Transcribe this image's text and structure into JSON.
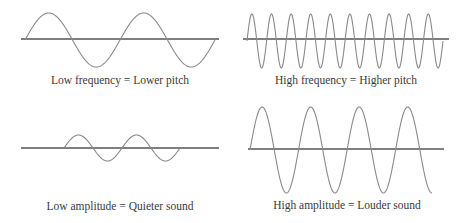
{
  "colors": {
    "wave": "#8a8a8a",
    "axis": "#555555",
    "text": "#3a3a3a",
    "background": "#ffffff"
  },
  "panels": [
    {
      "id": "low-frequency",
      "caption": "Low frequency = Lower pitch",
      "axis": {
        "y": 39,
        "x1": 21,
        "x2": 219
      },
      "wave": {
        "x_start": 25,
        "x_end": 215,
        "cycles": 2,
        "amplitude": 27,
        "baseline": 40
      }
    },
    {
      "id": "high-frequency",
      "caption": "High frequency = Higher pitch",
      "axis": {
        "y": 39,
        "x1": 243,
        "x2": 449
      },
      "wave": {
        "x_start": 247,
        "x_end": 443,
        "cycles": 10,
        "amplitude": 27,
        "baseline": 41
      }
    },
    {
      "id": "low-amplitude",
      "caption": "Low amplitude = Quieter sound",
      "axis": {
        "y": 148,
        "x1": 21,
        "x2": 219
      },
      "wave": {
        "x_start": 64,
        "x_end": 180,
        "cycles": 2,
        "amplitude": 13,
        "baseline": 148
      }
    },
    {
      "id": "high-amplitude",
      "caption": "High amplitude = Louder sound",
      "axis": {
        "y": 149,
        "x1": 248,
        "x2": 444
      },
      "wave": {
        "x_start": 250,
        "x_end": 432,
        "cycles": 3.75,
        "amplitude": 43,
        "baseline": 150
      }
    }
  ]
}
